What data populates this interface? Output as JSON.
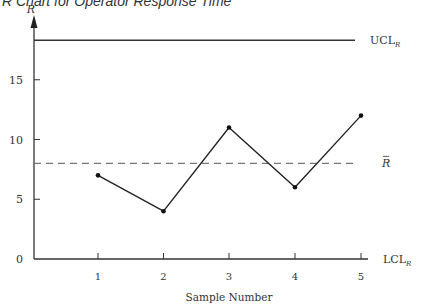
{
  "title": "R Chart for Operator Response Time",
  "chart_data": {
    "type": "line",
    "title": "R Chart for Operator Response Time",
    "xlabel": "Sample Number",
    "ylabel": "R",
    "categories": [
      1,
      2,
      3,
      4,
      5
    ],
    "x": [
      1,
      2,
      3,
      4,
      5
    ],
    "series": [
      {
        "name": "R",
        "values": [
          7,
          4,
          11,
          6,
          12
        ]
      }
    ],
    "reference_lines": [
      {
        "name": "UCL_R",
        "label": "UCL",
        "subscript": "R",
        "value": 18.3,
        "style": "solid"
      },
      {
        "name": "R-bar",
        "label": "R",
        "overbar": true,
        "value": 8,
        "style": "dashed"
      },
      {
        "name": "LCL_R",
        "label": "LCL",
        "subscript": "R",
        "value": 0,
        "style": "solid"
      }
    ],
    "yticks": [
      0,
      5,
      10,
      15
    ],
    "xticks": [
      1,
      2,
      3,
      4,
      5
    ],
    "ylim": [
      0,
      20
    ],
    "xlim": [
      0,
      5.5
    ],
    "grid": false,
    "legend": "none"
  }
}
